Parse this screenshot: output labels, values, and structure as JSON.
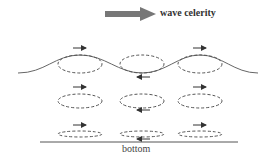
{
  "diagram": {
    "legend": {
      "arrow_label": "wave celerity",
      "icon": "thick-arrow-right"
    },
    "bottom_label": "bottom",
    "rows": [
      {
        "name": "surface",
        "ellipse_ry": 9,
        "y": 62,
        "orbits": [
          {
            "x": 80,
            "arrow": "right"
          },
          {
            "x": 142,
            "arrow": "left"
          },
          {
            "x": 200,
            "arrow": "right"
          }
        ]
      },
      {
        "name": "mid-depth",
        "ellipse_ry": 7,
        "y": 98,
        "orbits": [
          {
            "x": 80,
            "arrow": "right"
          },
          {
            "x": 142,
            "arrow": "left"
          },
          {
            "x": 200,
            "arrow": "right"
          }
        ]
      },
      {
        "name": "near-bottom",
        "ellipse_ry": 3,
        "y": 132,
        "orbits": [
          {
            "x": 80,
            "arrow": "right"
          },
          {
            "x": 142,
            "arrow": "left"
          },
          {
            "x": 200,
            "arrow": "right"
          }
        ]
      }
    ],
    "colors": {
      "line": "#555555",
      "arrow": "#333333",
      "legend_arrow": "#777777"
    }
  }
}
